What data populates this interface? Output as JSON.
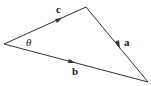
{
  "diagram": {
    "type": "vector-triangle",
    "vertices": {
      "left": [
        4,
        44
      ],
      "top": [
        86,
        7
      ],
      "right": [
        148,
        82
      ]
    },
    "edges": [
      {
        "name": "c",
        "from": "left",
        "to": "top",
        "label": "c",
        "label_pos": [
          56,
          13
        ]
      },
      {
        "name": "a",
        "from": "top",
        "to": "right",
        "label": "a",
        "label_pos": [
          124,
          46
        ]
      },
      {
        "name": "b",
        "from": "left",
        "to": "right",
        "label": "b",
        "label_pos": [
          72,
          75
        ]
      }
    ],
    "angle": {
      "label": "θ",
      "vertex": "left",
      "label_pos": [
        26,
        46
      ]
    },
    "stroke_color": "#333333"
  }
}
